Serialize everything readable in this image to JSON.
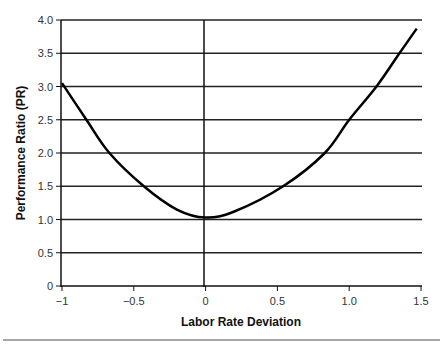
{
  "chart_data": {
    "type": "line",
    "title": "",
    "xlabel": "Labor Rate Deviation",
    "ylabel": "Performance Ratio (PR)",
    "xlim": [
      -1,
      1.5
    ],
    "ylim": [
      0,
      4.0
    ],
    "x_ticks": [
      "-1",
      "-0.5",
      "0",
      "0.5",
      "1.0",
      "1.5"
    ],
    "y_ticks": [
      "0",
      "0.5",
      "1.0",
      "1.5",
      "2.0",
      "2.5",
      "3.0",
      "3.5",
      "4.0"
    ],
    "grid": "horizontal",
    "legend": "none",
    "series": [
      {
        "name": "PR",
        "x": [
          -1.0,
          -0.83,
          -0.67,
          -0.43,
          -0.2,
          0.0,
          0.2,
          0.54,
          0.83,
          1.0,
          1.19,
          1.35,
          1.47
        ],
        "values": [
          3.05,
          2.5,
          2.0,
          1.5,
          1.15,
          1.03,
          1.12,
          1.5,
          2.0,
          2.5,
          3.0,
          3.5,
          3.87
        ]
      }
    ]
  }
}
